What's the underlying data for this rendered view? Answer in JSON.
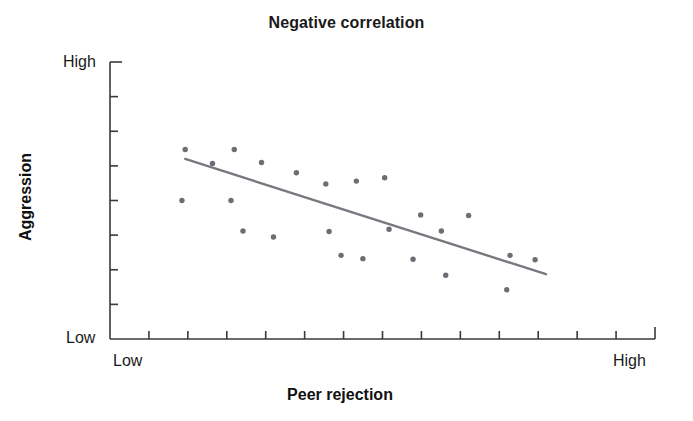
{
  "chart_data": {
    "type": "scatter",
    "title": "Negative correlation",
    "xlabel": "Peer rejection",
    "ylabel": "Aggression",
    "x_tick_labels": [
      "Low",
      "High"
    ],
    "y_tick_labels": [
      "Low",
      "High"
    ],
    "xlim": [
      0,
      100
    ],
    "ylim": [
      0,
      100
    ],
    "grid": false,
    "legend": "none",
    "x_axis_range_labels": {
      "min": "Low",
      "max": "High"
    },
    "y_axis_range_labels": {
      "min": "Low",
      "max": "High"
    },
    "x_tick_count": 13,
    "y_tick_count": 7,
    "point_color": "#6d6d75",
    "line_color": "#787880",
    "axis_color": "#3a3a3a",
    "points": [
      {
        "x": 13.8,
        "y": 68.4
      },
      {
        "x": 22.8,
        "y": 68.4
      },
      {
        "x": 18.8,
        "y": 63.4
      },
      {
        "x": 27.8,
        "y": 63.7
      },
      {
        "x": 13.2,
        "y": 50.0
      },
      {
        "x": 22.2,
        "y": 50.0
      },
      {
        "x": 39.6,
        "y": 56.0
      },
      {
        "x": 50.4,
        "y": 58.2
      },
      {
        "x": 34.2,
        "y": 60.0
      },
      {
        "x": 45.2,
        "y": 57.0
      },
      {
        "x": 24.4,
        "y": 39.0
      },
      {
        "x": 30.0,
        "y": 36.8
      },
      {
        "x": 40.2,
        "y": 38.8
      },
      {
        "x": 51.2,
        "y": 39.6
      },
      {
        "x": 57.0,
        "y": 44.8
      },
      {
        "x": 65.8,
        "y": 44.6
      },
      {
        "x": 60.8,
        "y": 39.0
      },
      {
        "x": 42.4,
        "y": 30.2
      },
      {
        "x": 46.4,
        "y": 29.0
      },
      {
        "x": 55.6,
        "y": 28.8
      },
      {
        "x": 73.4,
        "y": 30.2
      },
      {
        "x": 78.0,
        "y": 28.6
      },
      {
        "x": 61.6,
        "y": 23.0
      },
      {
        "x": 72.8,
        "y": 17.8
      }
    ],
    "trend_line": {
      "x0": 13.8,
      "y0": 65.0,
      "x1": 80.0,
      "y1": 23.4,
      "description": "downward sloping best-fit line indicating negative correlation"
    },
    "geometry": {
      "plot_left": 110,
      "plot_right": 655,
      "plot_top": 62,
      "plot_bottom": 339,
      "point_radius": 2.7,
      "tick_length_x": 8,
      "tick_length_y": 8
    }
  }
}
